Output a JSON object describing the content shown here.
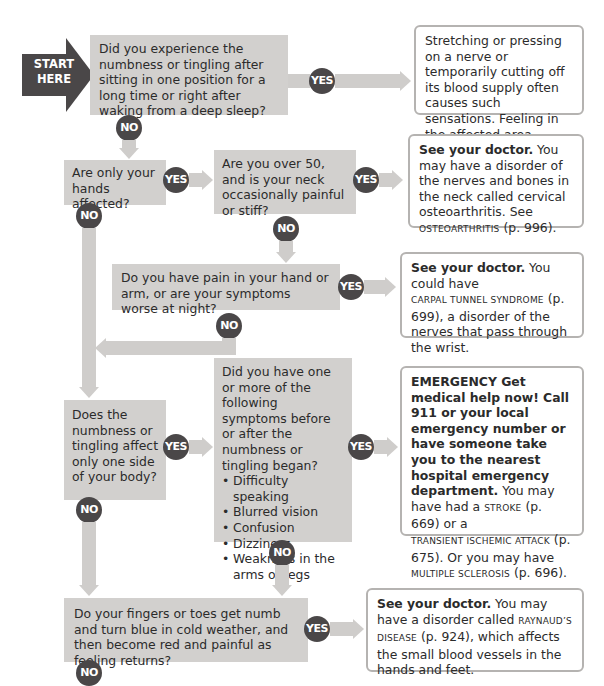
{
  "start": {
    "line1": "START",
    "line2": "HERE"
  },
  "labels": {
    "yes": "YES",
    "no": "NO"
  },
  "questions": [
    {
      "id": "q1",
      "text": "Did you experience the numbness or tingling after sitting in one position for a long time or right after waking from a deep sleep?"
    },
    {
      "id": "q2",
      "text": "Are only your hands affected?"
    },
    {
      "id": "q3",
      "text": "Are you over 50, and is your neck occasionally painful or stiff?"
    },
    {
      "id": "q4",
      "text": "Do you have pain in your hand or arm, or are your symptoms worse at night?"
    },
    {
      "id": "q5",
      "text": "Does the numbness or tingling affect only one side of your body?"
    },
    {
      "id": "q6",
      "text": "Did you have one or more of the following symptoms before or after the numbness or tingling began?",
      "symptoms": [
        "Difficulty speaking",
        "Blurred vision",
        "Confusion",
        "Dizziness",
        "Weakness in the arms or legs"
      ]
    },
    {
      "id": "q7",
      "text": "Do your fingers or toes get numb and turn blue in cold weather, and then become red and painful as feeling returns?"
    }
  ],
  "results": {
    "r1": {
      "text": "Stretching or pressing on a nerve or temporarily cutting off its blood supply often causes such sensations. Feeling in the affected area should return to normal in a few minutes."
    },
    "r3": {
      "bold": "See your doctor.",
      "text1": " You may have a disorder of the nerves and bones in the neck called cervical osteoarthritis. See ",
      "ref": "OSTEOARTHRITIS",
      "text2": " (p. 996)."
    },
    "r4": {
      "bold": "See your doctor.",
      "text1": " You could have ",
      "ref": "CARPAL TUNNEL SYNDROME",
      "text2": " (p. 699), a disorder of the nerves that pass through the wrist."
    },
    "r6": {
      "bold": "EMERGENCY  Get medical help now! Call 911 or your local emergency number or have someone take you to the nearest hospital emergency department.",
      "text1": " You may have had a ",
      "ref1": "STROKE",
      "text2": " (p. 669) or a ",
      "ref2": "TRANSIENT ISCHEMIC ATTACK",
      "text3": " (p. 675). Or you may have ",
      "ref3": "MULTIPLE SCLEROSIS",
      "text4": " (p. 696)."
    },
    "r7": {
      "bold": "See your doctor.",
      "text1": " You may have a disorder called ",
      "ref": "RAYNAUD’S DISEASE",
      "text2": " (p. 924), which affects the small blood vessels in the hands and feet."
    }
  },
  "colors": {
    "question_bg": "#d2d0ce",
    "badge": "#4a4748",
    "arrow": "#cfcdcb",
    "result_border": "#b5b3b1"
  }
}
